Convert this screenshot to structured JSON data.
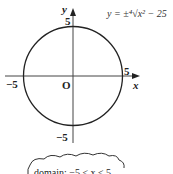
{
  "figure": {
    "equation": "y = ±⁴√x² − 25",
    "axes": {
      "x_label": "x",
      "y_label": "y",
      "origin_label": "O"
    },
    "ticks": {
      "x_pos": "5",
      "x_neg": "−5",
      "y_pos": "5",
      "y_neg": "−5"
    },
    "curve": {
      "type": "circle",
      "radius": 5,
      "center": [
        0,
        0
      ]
    },
    "callout": "domain: −5 ≤ x ≤ 5"
  }
}
